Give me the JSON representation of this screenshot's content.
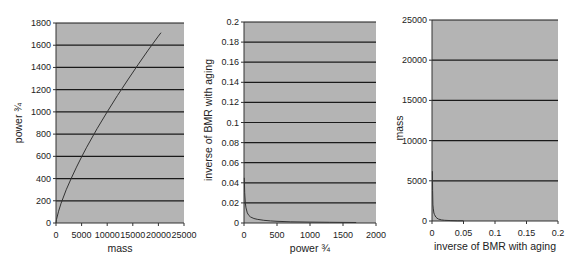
{
  "chart_data": [
    {
      "type": "line",
      "title": "",
      "xlabel": "mass",
      "ylabel": "power ¾",
      "xlim": [
        0,
        25000
      ],
      "ylim": [
        0,
        1800
      ],
      "xticks": [
        0,
        5000,
        10000,
        15000,
        20000,
        25000
      ],
      "xtick_labels": [
        "0",
        "5000",
        "10000",
        "15000",
        "20000",
        "25000"
      ],
      "yticks": [
        0,
        200,
        400,
        600,
        800,
        1000,
        1200,
        1400,
        1600,
        1800
      ],
      "ytick_labels": [
        "0",
        "200",
        "400",
        "600",
        "800",
        "1000",
        "1200",
        "1400",
        "1600",
        "1800"
      ],
      "grid": "horizontal",
      "legend": "none",
      "series": [
        {
          "name": "power ¾ vs mass",
          "x": [
            0,
            100,
            500,
            1000,
            2000,
            3000,
            4000,
            5000,
            6000,
            8000,
            10000,
            12000,
            14000,
            16000,
            18000,
            20000,
            20500
          ],
          "y": [
            0,
            32,
            106,
            178,
            299,
            405,
            503,
            595,
            682,
            848,
            1000,
            1147,
            1287,
            1423,
            1556,
            1682,
            1713
          ]
        }
      ],
      "plot_box": {
        "left": 56,
        "top": 23,
        "right": 184,
        "bottom": 223
      },
      "ylabel_pos": {
        "x": 22,
        "y": 123
      }
    },
    {
      "type": "line",
      "title": "",
      "xlabel": "power ¾",
      "ylabel": "inverse of BMR with aging",
      "xlim": [
        0,
        2000
      ],
      "ylim": [
        0,
        0.2
      ],
      "xticks": [
        0,
        500,
        1000,
        1500,
        2000
      ],
      "xtick_labels": [
        "0",
        "500",
        "1000",
        "1500",
        "2000"
      ],
      "yticks": [
        0,
        0.02,
        0.04,
        0.06,
        0.08,
        0.1,
        0.12,
        0.14,
        0.16,
        0.18,
        0.2
      ],
      "ytick_labels": [
        "0",
        "0.02",
        "0.04",
        "0.06",
        "0.08",
        "0.1",
        "0.12",
        "0.14",
        "0.16",
        "0.18",
        "0.2"
      ],
      "grid": "horizontal",
      "legend": "none",
      "series": [
        {
          "name": "inverse of BMR vs power ¾",
          "x": [
            5,
            10,
            20,
            30,
            50,
            75,
            100,
            150,
            200,
            300,
            400,
            500,
            700,
            1000,
            1300,
            1700
          ],
          "y": [
            0.045,
            0.03,
            0.02,
            0.015,
            0.01,
            0.0075,
            0.006,
            0.0045,
            0.0037,
            0.0027,
            0.0021,
            0.0017,
            0.0012,
            0.0009,
            0.0007,
            0.0005
          ]
        }
      ],
      "plot_box": {
        "left": 244,
        "top": 22,
        "right": 376,
        "bottom": 223
      },
      "ylabel_pos": {
        "x": 212,
        "y": 120
      }
    },
    {
      "type": "line",
      "title": "",
      "xlabel": "inverse of BMR with aging",
      "ylabel": "mass",
      "xlim": [
        0,
        0.2
      ],
      "ylim": [
        0,
        25000
      ],
      "xticks": [
        0,
        0.05,
        0.1,
        0.15,
        0.2
      ],
      "xtick_labels": [
        "0",
        "0.05",
        "0.1",
        "0.15",
        "0.2"
      ],
      "yticks": [
        0,
        5000,
        10000,
        15000,
        20000,
        25000
      ],
      "ytick_labels": [
        "0",
        "5000",
        "10000",
        "15000",
        "20000",
        "25000"
      ],
      "grid": "horizontal",
      "legend": "none",
      "series": [
        {
          "name": "mass vs inverse of BMR",
          "x": [
            0.0007,
            0.001,
            0.0015,
            0.002,
            0.003,
            0.004,
            0.006,
            0.008,
            0.01,
            0.015,
            0.02,
            0.03,
            0.04,
            0.05
          ],
          "y": [
            6200,
            3800,
            2000,
            1500,
            1000,
            800,
            500,
            350,
            250,
            140,
            90,
            50,
            30,
            20
          ]
        }
      ],
      "plot_box": {
        "left": 432,
        "top": 20,
        "right": 558,
        "bottom": 221
      },
      "ylabel_pos": {
        "x": 403,
        "y": 128
      }
    }
  ],
  "colors": {
    "plot_background": "#b4b4b4",
    "gridline": "#1a1a1a",
    "series_line": "#333333",
    "page_background": "#ffffff"
  }
}
